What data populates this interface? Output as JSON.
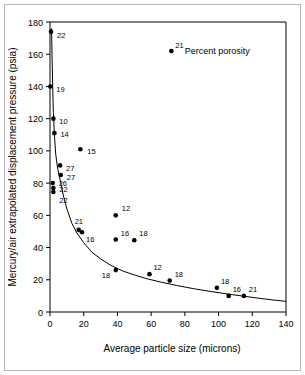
{
  "chart_data": {
    "type": "scatter",
    "title": "",
    "xlabel": "Average particle size (microns)",
    "ylabel": "Mercury/air extrapolated displacement pressure (psia)",
    "xlim": [
      0,
      140
    ],
    "ylim": [
      0,
      180
    ],
    "xticks": [
      0,
      20,
      40,
      60,
      80,
      100,
      120,
      140
    ],
    "yticks": [
      0,
      20,
      40,
      60,
      80,
      100,
      120,
      140,
      160,
      180
    ],
    "grid": false,
    "legend": "none",
    "annotations": [
      {
        "text": "Percent porosity",
        "x": 80,
        "y": 162
      }
    ],
    "point_label_meaning": "Percent porosity",
    "points": [
      {
        "x": 0.6,
        "y": 174,
        "label": "22",
        "lx": 6,
        "ly": 6
      },
      {
        "x": 0.2,
        "y": 140,
        "label": "19",
        "lx": 6,
        "ly": 6
      },
      {
        "x": 2.0,
        "y": 120,
        "label": "10",
        "lx": 6,
        "ly": 5
      },
      {
        "x": 2.6,
        "y": 111,
        "label": "14",
        "lx": 6,
        "ly": 4
      },
      {
        "x": 18.0,
        "y": 101,
        "label": "15",
        "lx": 7,
        "ly": 5
      },
      {
        "x": 6.0,
        "y": 91,
        "label": "27",
        "lx": 6,
        "ly": 6
      },
      {
        "x": 6.4,
        "y": 85,
        "label": "27",
        "lx": 6,
        "ly": 5
      },
      {
        "x": 1.6,
        "y": 80,
        "label": "26",
        "lx": 6,
        "ly": 3
      },
      {
        "x": 2.0,
        "y": 77,
        "label": "22",
        "lx": 6,
        "ly": 4
      },
      {
        "x": 2.0,
        "y": 74.5,
        "label": "22",
        "lx": 6,
        "ly": 11
      },
      {
        "x": 39.0,
        "y": 60,
        "label": "12",
        "lx": 6,
        "ly": -4
      },
      {
        "x": 17.0,
        "y": 51,
        "label": "21",
        "lx": -4,
        "ly": -6
      },
      {
        "x": 19.0,
        "y": 49.5,
        "label": "16",
        "lx": 4,
        "ly": 10
      },
      {
        "x": 39.0,
        "y": 45,
        "label": "16",
        "lx": 5,
        "ly": -4
      },
      {
        "x": 50.0,
        "y": 44.5,
        "label": "18",
        "lx": 5,
        "ly": -4
      },
      {
        "x": 39.0,
        "y": 26,
        "label": "18",
        "lx": -14,
        "ly": 8
      },
      {
        "x": 59.0,
        "y": 23.5,
        "label": "12",
        "lx": 4,
        "ly": -4
      },
      {
        "x": 71.0,
        "y": 19.5,
        "label": "18",
        "lx": 5,
        "ly": -4
      },
      {
        "x": 99.0,
        "y": 15,
        "label": "18",
        "lx": 4,
        "ly": -4
      },
      {
        "x": 106.0,
        "y": 10,
        "label": "16",
        "lx": 4,
        "ly": -4
      },
      {
        "x": 115.0,
        "y": 10,
        "label": "21",
        "lx": 5,
        "ly": -4
      },
      {
        "x": 72.0,
        "y": 162,
        "label": "21",
        "lx": 4,
        "ly": -3
      }
    ],
    "fit_curve": {
      "description": "decaying hyperbolic trend line",
      "x": [
        0.9,
        1.2,
        1.6,
        2.0,
        2.6,
        3.4,
        4.4,
        5.6,
        6.6,
        8,
        10,
        13,
        16,
        20,
        25,
        30,
        36,
        43,
        50,
        58,
        66,
        75,
        85,
        95,
        105,
        115,
        125,
        133,
        140
      ],
      "y": [
        176,
        160,
        140,
        124,
        110,
        98,
        90,
        84,
        79,
        72,
        64,
        55,
        49,
        43,
        37,
        33,
        29,
        25.5,
        23,
        20.5,
        18.5,
        16.5,
        14.5,
        12.8,
        11.2,
        9.8,
        8.4,
        7.4,
        6.6
      ]
    }
  }
}
